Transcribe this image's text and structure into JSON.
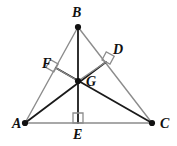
{
  "figure": {
    "kind": "geometry-diagram",
    "background_color": "#ffffff",
    "stroke_light": "#8c8c8c",
    "stroke_dark": "#1a1a1a",
    "point_color": "#111111",
    "label_color": "#111111"
  },
  "points": {
    "A": {
      "label": "A",
      "x": 25,
      "y": 123,
      "label_x": 12,
      "label_y": 128,
      "dot": true
    },
    "B": {
      "label": "B",
      "x": 78,
      "y": 27,
      "label_x": 72,
      "label_y": 17,
      "dot": true
    },
    "C": {
      "label": "C",
      "x": 152,
      "y": 123,
      "label_x": 160,
      "label_y": 128,
      "dot": true
    },
    "D": {
      "label": "D",
      "x": 106,
      "y": 62,
      "label_x": 113,
      "label_y": 54,
      "dot": false
    },
    "E": {
      "label": "E",
      "x": 78,
      "y": 123,
      "label_x": 73,
      "label_y": 139,
      "dot": false
    },
    "F": {
      "label": "F",
      "x": 56,
      "y": 68,
      "label_x": 42,
      "label_y": 68,
      "dot": false
    },
    "G": {
      "label": "G",
      "x": 78,
      "y": 81,
      "label_x": 86,
      "label_y": 86,
      "dot": true
    }
  },
  "segments": [
    {
      "name": "side-AB",
      "from": "A",
      "to": "B",
      "tone": "light",
      "width": 1.4
    },
    {
      "name": "side-BC",
      "from": "B",
      "to": "C",
      "tone": "light",
      "width": 1.4
    },
    {
      "name": "side-AC",
      "from": "A",
      "to": "C",
      "tone": "light",
      "width": 1.6
    },
    {
      "name": "altitude-AD",
      "from": "A",
      "to": "D",
      "tone": "dark",
      "width": 1.8
    },
    {
      "name": "altitude-CF",
      "from": "C",
      "to": "F",
      "tone": "dark",
      "width": 1.8
    },
    {
      "name": "altitude-BE",
      "from": "B",
      "to": "E",
      "tone": "dark",
      "width": 1.8
    },
    {
      "name": "extension-GD",
      "from": "G",
      "to": "D",
      "tone": "light",
      "width": 1.4
    },
    {
      "name": "extension-GF",
      "from": "G",
      "to": "F",
      "tone": "light",
      "width": 1.4
    }
  ],
  "right_angles": [
    {
      "name": "right-angle-at-F",
      "at": "F",
      "size": 9,
      "rotation": -61
    },
    {
      "name": "right-angle-at-D",
      "at": "D",
      "size": 9,
      "rotation": 28
    },
    {
      "name": "right-angle-at-E",
      "at": "E",
      "size": 10,
      "rotation": 0
    }
  ],
  "labels": [
    "A",
    "B",
    "C",
    "D",
    "E",
    "F",
    "G"
  ]
}
